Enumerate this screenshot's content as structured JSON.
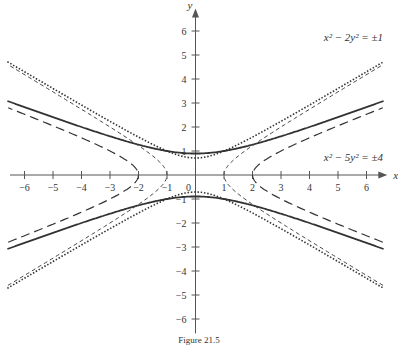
{
  "figure": {
    "caption": "Figure 21.5"
  },
  "chart_data": {
    "type": "line",
    "title": "",
    "xlabel": "x",
    "ylabel": "y",
    "xlim": [
      -6.6,
      6.6
    ],
    "ylim": [
      -6.5,
      6.5
    ],
    "grid": false,
    "x_ticks": [
      -6,
      -5,
      -4,
      -3,
      -2,
      -1,
      0,
      1,
      2,
      3,
      4,
      5,
      6
    ],
    "y_ticks": [
      -6,
      -5,
      -4,
      -3,
      -2,
      -1,
      1,
      2,
      3,
      4,
      5,
      6
    ],
    "annotations": [
      {
        "text": "x² − 2y² = ±1",
        "position": [
          4.8,
          5.6
        ]
      },
      {
        "text": "x² − 5y² = ±4",
        "position": [
          4.8,
          0.6
        ]
      }
    ],
    "series": [
      {
        "name": "x² − 5y² = −4",
        "style": "solid",
        "equation": "y = ±sqrt((x²+4)/5)",
        "vertex": [
          0,
          0.894
        ]
      },
      {
        "name": "x² − 5y² = 4",
        "style": "long-dash",
        "equation": "x = ±sqrt(4+5y²)",
        "vertex": [
          2,
          0
        ]
      },
      {
        "name": "x² − 2y² = −1",
        "style": "dotted",
        "equation": "y = ±sqrt((x²+1)/2)",
        "vertex": [
          0,
          0.707
        ]
      },
      {
        "name": "x² − 2y² = 1",
        "style": "short-dash",
        "equation": "x = ±sqrt(1+2y²)",
        "vertex": [
          1,
          0
        ]
      }
    ]
  }
}
